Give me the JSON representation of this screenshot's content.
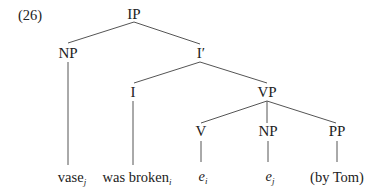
{
  "diagram": {
    "example_number": "(26)",
    "type": "syntax-tree",
    "nodes": {
      "ip": {
        "label": "IP"
      },
      "np_subject": {
        "label": "NP"
      },
      "i_bar": {
        "label": "I′"
      },
      "i": {
        "label": "I"
      },
      "vp": {
        "label": "VP"
      },
      "v": {
        "label": "V"
      },
      "np_object": {
        "label": "NP"
      },
      "pp": {
        "label": "PP"
      }
    },
    "leaves": {
      "vase": {
        "text": "vase",
        "index": "j"
      },
      "was_broken": {
        "text": "was broken",
        "index": "i"
      },
      "e_i": {
        "text": "e",
        "index": "i"
      },
      "e_j": {
        "text": "e",
        "index": "j"
      },
      "by_tom": {
        "text": "(by Tom)"
      }
    },
    "edges": [
      [
        "IP",
        "NP"
      ],
      [
        "IP",
        "I′"
      ],
      [
        "I′",
        "I"
      ],
      [
        "I′",
        "VP"
      ],
      [
        "VP",
        "V"
      ],
      [
        "VP",
        "NP"
      ],
      [
        "VP",
        "PP"
      ],
      [
        "NP",
        "vase_j"
      ],
      [
        "I",
        "was broken_i"
      ],
      [
        "V",
        "e_i"
      ],
      [
        "NP",
        "e_j"
      ],
      [
        "PP",
        "(by Tom)"
      ]
    ]
  }
}
